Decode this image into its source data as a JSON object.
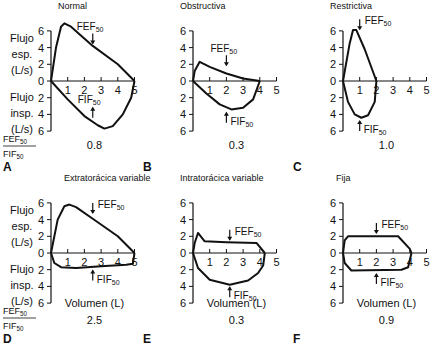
{
  "figure": {
    "row_labels": {
      "exp": [
        "Flujo",
        "esp.",
        "(L/s)"
      ],
      "insp": [
        "Flujo",
        "insp.",
        "(L/s)"
      ],
      "ratio_num": "FEF",
      "ratio_den": "FIF",
      "ratio_sub": "50"
    },
    "xlabel": "Volumen (L)",
    "fef_label": "FEF",
    "fif_label": "FIF",
    "sub": "50"
  },
  "chart_data": [
    {
      "panel": "A",
      "title": "Normal",
      "type": "line",
      "ratio": "0.8",
      "xlim": [
        0,
        5
      ],
      "ylim": [
        -6,
        6
      ],
      "xticks": [
        1,
        2,
        3,
        4,
        5
      ],
      "yticks": [
        6,
        4,
        2,
        0,
        2,
        4,
        6
      ],
      "expiratory": [
        [
          0,
          0
        ],
        [
          0.3,
          4
        ],
        [
          0.6,
          6.5
        ],
        [
          0.8,
          6.9
        ],
        [
          1.2,
          6.5
        ],
        [
          2.5,
          4.2
        ],
        [
          4,
          2
        ],
        [
          5,
          0
        ]
      ],
      "inspiratory": [
        [
          0,
          0
        ],
        [
          1,
          -2.2
        ],
        [
          2,
          -4.2
        ],
        [
          2.8,
          -5.3
        ],
        [
          3.2,
          -5.7
        ],
        [
          3.7,
          -5.4
        ],
        [
          4.3,
          -4
        ],
        [
          4.8,
          -2
        ],
        [
          5,
          0
        ]
      ],
      "fef": {
        "x": 2.5,
        "y": 4.5,
        "label_dx": -0.6,
        "side": "exp"
      },
      "fif": {
        "x": 2.5,
        "y": -3.2,
        "side": "insp"
      }
    },
    {
      "panel": "B",
      "title": "Obstructiva",
      "type": "line",
      "ratio": "0.3",
      "xlim": [
        0,
        5
      ],
      "ylim": [
        -6,
        6
      ],
      "xticks": [
        1,
        2,
        3,
        4,
        5
      ],
      "yticks": [
        6,
        4,
        2,
        0,
        2,
        4,
        6
      ],
      "expiratory": [
        [
          0,
          0
        ],
        [
          0.1,
          1.2
        ],
        [
          0.4,
          2.3
        ],
        [
          1,
          1.7
        ],
        [
          2,
          0.9
        ],
        [
          3,
          0.3
        ],
        [
          4,
          0
        ]
      ],
      "inspiratory": [
        [
          0,
          0
        ],
        [
          0.8,
          -1.5
        ],
        [
          1.6,
          -2.8
        ],
        [
          2.3,
          -3.4
        ],
        [
          3,
          -3.2
        ],
        [
          3.6,
          -2.2
        ],
        [
          4,
          0
        ]
      ],
      "fef": {
        "x": 2,
        "y": 1.9,
        "side": "exp"
      },
      "fif": {
        "x": 2,
        "y": -3.8,
        "side": "insp"
      }
    },
    {
      "panel": "C",
      "title": "Restrictiva",
      "type": "line",
      "ratio": "1.0",
      "xlim": [
        0,
        5
      ],
      "ylim": [
        -6,
        6
      ],
      "xticks": [
        1,
        2,
        3,
        4,
        5
      ],
      "yticks": [
        6,
        4,
        2,
        0,
        2,
        4,
        6
      ],
      "expiratory": [
        [
          0,
          0
        ],
        [
          0.4,
          4.5
        ],
        [
          0.6,
          6.1
        ],
        [
          0.8,
          6.1
        ],
        [
          1.3,
          3.8
        ],
        [
          2,
          0
        ]
      ],
      "inspiratory": [
        [
          0,
          0
        ],
        [
          0.3,
          -2.5
        ],
        [
          0.7,
          -4
        ],
        [
          1.1,
          -4.4
        ],
        [
          1.5,
          -4.1
        ],
        [
          1.9,
          -2.5
        ],
        [
          2,
          0
        ]
      ],
      "fef": {
        "x": 1,
        "y": 6.2,
        "side": "exp-right"
      },
      "fif": {
        "x": 1,
        "y": -4.8,
        "side": "insp"
      }
    },
    {
      "panel": "D",
      "title": "Extratorácica variable",
      "type": "line",
      "ratio": "2.5",
      "xlim": [
        0,
        5
      ],
      "ylim": [
        -6,
        6
      ],
      "xticks": [
        1,
        2,
        3,
        4,
        5
      ],
      "yticks": [
        6,
        4,
        2,
        0,
        2,
        4,
        6
      ],
      "expiratory": [
        [
          0,
          0
        ],
        [
          0.4,
          4
        ],
        [
          0.8,
          5.6
        ],
        [
          1.1,
          5.8
        ],
        [
          1.5,
          5.5
        ],
        [
          2.5,
          4.1
        ],
        [
          4,
          2
        ],
        [
          5,
          0
        ]
      ],
      "inspiratory": [
        [
          0,
          0
        ],
        [
          0.2,
          -1.2
        ],
        [
          0.6,
          -1.7
        ],
        [
          1.5,
          -1.8
        ],
        [
          3,
          -1.6
        ],
        [
          4.5,
          -1.4
        ],
        [
          4.9,
          -1.3
        ],
        [
          5,
          0
        ]
      ],
      "fef": {
        "x": 2.5,
        "y": 4.8,
        "side": "exp-right"
      },
      "fif": {
        "x": 2.5,
        "y": -2.1,
        "side": "insp"
      }
    },
    {
      "panel": "E",
      "title": "Intratorácica variable",
      "type": "line",
      "ratio": "0.3",
      "xlim": [
        0,
        5
      ],
      "ylim": [
        -6,
        6
      ],
      "xticks": [
        1,
        2,
        3,
        4,
        5
      ],
      "yticks": [
        6,
        4,
        2,
        0,
        2,
        4,
        6
      ],
      "expiratory": [
        [
          0,
          0
        ],
        [
          0.1,
          1.2
        ],
        [
          0.3,
          2.4
        ],
        [
          0.7,
          1.4
        ],
        [
          2,
          1.3
        ],
        [
          3.8,
          1.2
        ],
        [
          4.3,
          0
        ]
      ],
      "inspiratory": [
        [
          0,
          0
        ],
        [
          0.3,
          -1.8
        ],
        [
          1,
          -3.2
        ],
        [
          2.2,
          -3.8
        ],
        [
          3.3,
          -3.3
        ],
        [
          3.9,
          -2.4
        ],
        [
          4.2,
          -1.5
        ],
        [
          4.3,
          0
        ]
      ],
      "fef": {
        "x": 2.2,
        "y": 1.6,
        "side": "exp-right"
      },
      "fif": {
        "x": 2.2,
        "y": -4.1,
        "side": "insp"
      }
    },
    {
      "panel": "F",
      "title": "Fija",
      "type": "line",
      "ratio": "0.9",
      "xlim": [
        0,
        5
      ],
      "ylim": [
        -6,
        6
      ],
      "xticks": [
        1,
        2,
        3,
        4,
        5
      ],
      "yticks": [
        6,
        4,
        2,
        0,
        2,
        4,
        6
      ],
      "expiratory": [
        [
          0,
          0
        ],
        [
          0.1,
          1.5
        ],
        [
          0.3,
          2
        ],
        [
          3.3,
          2
        ],
        [
          4,
          0.5
        ],
        [
          4.1,
          0
        ]
      ],
      "inspiratory": [
        [
          0,
          0
        ],
        [
          0.1,
          -1.2
        ],
        [
          0.5,
          -2.1
        ],
        [
          3.5,
          -2
        ],
        [
          3.9,
          -1.7
        ],
        [
          4.1,
          0
        ]
      ],
      "fef": {
        "x": 2,
        "y": 2.4,
        "side": "exp-right"
      },
      "fif": {
        "x": 2,
        "y": -2.5,
        "side": "insp"
      }
    }
  ]
}
